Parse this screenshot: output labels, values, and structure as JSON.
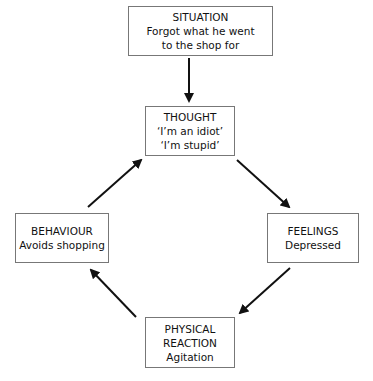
{
  "diagram": {
    "type": "cognitive-behavioural cycle",
    "nodes": {
      "situation": {
        "title": "SITUATION",
        "lines": [
          "Forgot what he went",
          "to the shop for"
        ]
      },
      "thought": {
        "title": "THOUGHT",
        "lines": [
          "‘I’m an idiot’",
          "‘I’m stupid’"
        ]
      },
      "feelings": {
        "title": "FEELINGS",
        "lines": [
          "Depressed"
        ]
      },
      "physical": {
        "title": "PHYSICAL",
        "lines": [
          "REACTION",
          "Agitation"
        ]
      },
      "behaviour": {
        "title": "BEHAVIOUR",
        "lines": [
          "Avoids shopping"
        ]
      }
    },
    "edges": [
      {
        "from": "situation",
        "to": "thought"
      },
      {
        "from": "thought",
        "to": "feelings"
      },
      {
        "from": "feelings",
        "to": "physical"
      },
      {
        "from": "physical",
        "to": "behaviour"
      },
      {
        "from": "behaviour",
        "to": "thought"
      }
    ],
    "colors": {
      "border": "#777777",
      "arrow": "#111111",
      "text": "#111111"
    }
  }
}
